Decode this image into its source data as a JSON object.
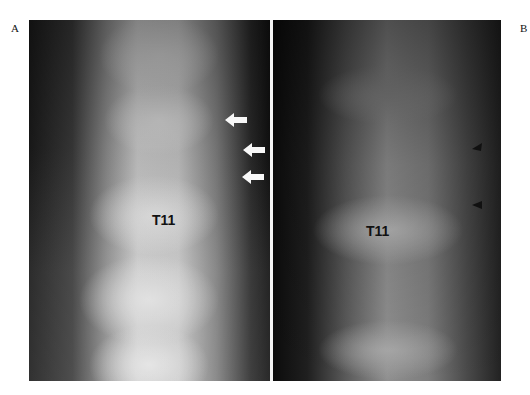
{
  "figure": {
    "panels": [
      {
        "letter": "A",
        "type": "radiograph",
        "vertebra_label": "T11",
        "markers": [
          {
            "icon": "white-arrow-left-icon",
            "y": 120
          },
          {
            "icon": "white-arrow-left-icon",
            "y": 150
          },
          {
            "icon": "white-arrow-left-icon",
            "y": 177
          }
        ]
      },
      {
        "letter": "B",
        "type": "tomogram",
        "vertebra_label": "T11",
        "markers": [
          {
            "icon": "black-arrowhead-left-icon",
            "y": 146
          },
          {
            "icon": "black-arrowhead-left-icon",
            "y": 204
          }
        ]
      }
    ]
  }
}
